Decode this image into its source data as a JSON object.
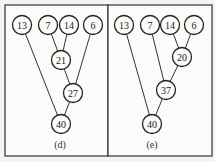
{
  "diagrams": [
    {
      "caption": "(d)",
      "nodes": [
        {
          "id": "n13",
          "label": "13",
          "x": 22,
          "y": 25
        },
        {
          "id": "n7",
          "label": "7",
          "x": 48,
          "y": 25
        },
        {
          "id": "n14",
          "label": "14",
          "x": 69,
          "y": 25
        },
        {
          "id": "n6",
          "label": "6",
          "x": 93,
          "y": 25
        },
        {
          "id": "n21",
          "label": "21",
          "x": 61,
          "y": 60
        },
        {
          "id": "n27",
          "label": "27",
          "x": 73,
          "y": 93
        },
        {
          "id": "n40",
          "label": "40",
          "x": 61,
          "y": 124
        }
      ],
      "edges": [
        [
          "n7",
          "n21"
        ],
        [
          "n14",
          "n21"
        ],
        [
          "n21",
          "n27"
        ],
        [
          "n6",
          "n27"
        ],
        [
          "n27",
          "n40"
        ],
        [
          "n13",
          "n40"
        ]
      ],
      "caption_pos": {
        "x": 60,
        "y": 148
      }
    },
    {
      "caption": "(e)",
      "nodes": [
        {
          "id": "m13",
          "label": "13",
          "x": 124,
          "y": 25
        },
        {
          "id": "m7",
          "label": "7",
          "x": 150,
          "y": 25
        },
        {
          "id": "m14",
          "label": "14",
          "x": 170,
          "y": 25
        },
        {
          "id": "m6",
          "label": "6",
          "x": 194,
          "y": 25
        },
        {
          "id": "m20",
          "label": "20",
          "x": 182,
          "y": 57
        },
        {
          "id": "m37",
          "label": "37",
          "x": 166,
          "y": 90
        },
        {
          "id": "m40",
          "label": "40",
          "x": 152,
          "y": 124
        }
      ],
      "edges": [
        [
          "m14",
          "m20"
        ],
        [
          "m6",
          "m20"
        ],
        [
          "m20",
          "m37"
        ],
        [
          "m7",
          "m37"
        ],
        [
          "m37",
          "m40"
        ],
        [
          "m13",
          "m40"
        ]
      ],
      "caption_pos": {
        "x": 152,
        "y": 148
      }
    }
  ]
}
